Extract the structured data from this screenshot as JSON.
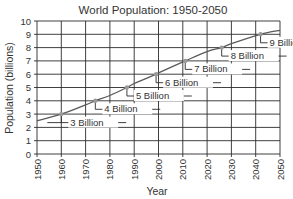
{
  "chart_data": {
    "type": "line",
    "title": "World Population: 1950-2050",
    "xlabel": "Year",
    "ylabel": "Population (billions)",
    "xlim": [
      1950,
      2050
    ],
    "ylim": [
      0,
      10
    ],
    "x_ticks": [
      1950,
      1960,
      1970,
      1980,
      1990,
      2000,
      2010,
      2020,
      2030,
      2040,
      2050
    ],
    "y_ticks": [
      0,
      1,
      2,
      3,
      4,
      5,
      6,
      7,
      8,
      9,
      10
    ],
    "grid": true,
    "legend": "none",
    "series": [
      {
        "name": "World population",
        "x": [
          1950,
          1960,
          1970,
          1974,
          1980,
          1987,
          1990,
          1999,
          2000,
          2011,
          2020,
          2026,
          2030,
          2042,
          2050
        ],
        "values": [
          2.5,
          3.0,
          3.7,
          4.0,
          4.4,
          5.0,
          5.3,
          6.0,
          6.1,
          7.0,
          7.7,
          8.0,
          8.3,
          9.0,
          9.3
        ]
      }
    ],
    "annotations": [
      {
        "label": "3 Billion",
        "year": 1960,
        "value": 3
      },
      {
        "label": "4 Billion",
        "year": 1974,
        "value": 4
      },
      {
        "label": "5 Billion",
        "year": 1987,
        "value": 5
      },
      {
        "label": "6 Billion",
        "year": 1999,
        "value": 6
      },
      {
        "label": "7 Billion",
        "year": 2011,
        "value": 7
      },
      {
        "label": "8 Billion",
        "year": 2026,
        "value": 8
      },
      {
        "label": "9 Billion",
        "year": 2042,
        "value": 9
      }
    ]
  },
  "colors": {
    "grid": "#2b2b2b",
    "line": "#5a5a5a",
    "marker": "#9a9a9a",
    "text": "#333333"
  }
}
